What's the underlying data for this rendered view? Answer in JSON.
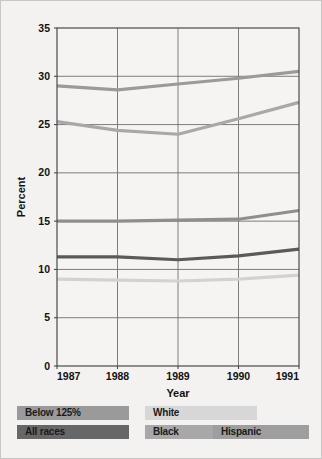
{
  "chart_data": {
    "type": "line",
    "title": "",
    "xlabel": "Year",
    "ylabel": "Percent",
    "categories": [
      "1987",
      "1988",
      "1989",
      "1990",
      "1991"
    ],
    "x": [
      1987,
      1988,
      1989,
      1990,
      1991
    ],
    "xlim": [
      1987,
      1991
    ],
    "ylim": [
      0,
      35
    ],
    "yticks": [
      0,
      5,
      10,
      15,
      20,
      25,
      30,
      35
    ],
    "xticks": [
      "1987",
      "1988",
      "1989",
      "1990",
      "1991"
    ],
    "grid": true,
    "legend_position": "bottom",
    "series": [
      {
        "name": "Below 125%",
        "color": "#9a9a9a",
        "values": [
          29.0,
          28.6,
          29.2,
          29.8,
          30.5
        ]
      },
      {
        "name": "Black",
        "color": "#a8a8a8",
        "values": [
          25.3,
          24.4,
          24.0,
          25.6,
          27.3
        ]
      },
      {
        "name": "Hispanic",
        "color": "#8e8e8e",
        "values": [
          15.0,
          15.0,
          15.1,
          15.2,
          16.1
        ]
      },
      {
        "name": "All races",
        "color": "#5a5a5a",
        "values": [
          11.3,
          11.3,
          11.0,
          11.4,
          12.1
        ]
      },
      {
        "name": "White",
        "color": "#d2d2d2",
        "values": [
          9.0,
          8.9,
          8.8,
          9.0,
          9.4
        ]
      }
    ]
  },
  "legend": {
    "rows": [
      [
        {
          "label": "Below 125%",
          "color": "#9a9a9a"
        },
        {
          "label": "White",
          "color": "#d7d7d7"
        }
      ],
      [
        {
          "label": "All races",
          "color": "#676767"
        },
        {
          "label": "Black",
          "color": "#a8a8a8"
        },
        {
          "label": "Hispanic",
          "color": "#9e9e9e"
        }
      ]
    ]
  },
  "axes": {
    "y_title": "Percent",
    "x_title": "Year"
  },
  "colors": {
    "background": "#f3f2f0",
    "plot_background": "#f5f4f2",
    "grid": "#6f6f6f",
    "axis": "#4a4a4a",
    "text": "#111111"
  }
}
